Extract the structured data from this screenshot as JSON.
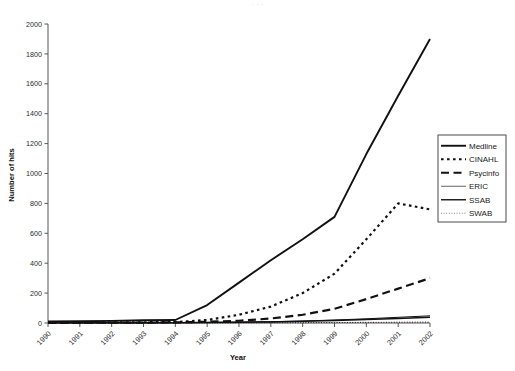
{
  "top_strip_text": "· ·   ·",
  "chart_data": {
    "type": "line",
    "title": "",
    "xlabel": "Year",
    "ylabel": "Number of hits",
    "x": [
      1990,
      1991,
      1992,
      1993,
      1994,
      1995,
      1996,
      1997,
      1998,
      1999,
      2000,
      2001,
      2002
    ],
    "categories": [
      "1990",
      "1991",
      "1992",
      "1993",
      "1994",
      "1995",
      "1996",
      "1997",
      "1998",
      "1999",
      "2000",
      "2001",
      "2002"
    ],
    "ylim": [
      0,
      2000
    ],
    "yticks": [
      0,
      200,
      400,
      600,
      800,
      1000,
      1200,
      1400,
      1600,
      1800,
      2000
    ],
    "ytick_labels": [
      "0",
      "200",
      "400",
      "600",
      "800",
      "1000",
      "1200",
      "1400",
      "1600",
      "1800",
      "2000"
    ],
    "grid": false,
    "legend_position": "right",
    "series": [
      {
        "name": "Medline",
        "style": "solid",
        "stroke_width": 1.9,
        "color": "#111111",
        "values": [
          10,
          12,
          14,
          18,
          20,
          120,
          270,
          420,
          560,
          710,
          1130,
          1520,
          1900
        ]
      },
      {
        "name": "CINAHL",
        "style": "dotted-dash",
        "stroke_width": 2.2,
        "color": "#111111",
        "values": [
          2,
          3,
          4,
          5,
          6,
          20,
          55,
          110,
          200,
          330,
          560,
          800,
          760
        ]
      },
      {
        "name": "Psycinfo",
        "style": "long-dash",
        "stroke_width": 2.2,
        "color": "#111111",
        "values": [
          1,
          2,
          2,
          3,
          4,
          8,
          15,
          30,
          55,
          95,
          160,
          230,
          300
        ]
      },
      {
        "name": "ERIC",
        "style": "solid-thin",
        "stroke_width": 1.0,
        "color": "#666666",
        "values": [
          1,
          1,
          2,
          2,
          3,
          4,
          6,
          9,
          13,
          20,
          28,
          38,
          48
        ]
      },
      {
        "name": "SSAB",
        "style": "solid-medium",
        "stroke_width": 1.5,
        "color": "#222222",
        "values": [
          1,
          1,
          1,
          2,
          2,
          3,
          5,
          7,
          11,
          16,
          23,
          30,
          38
        ]
      },
      {
        "name": "SWAB",
        "style": "fine-dotted",
        "stroke_width": 1.0,
        "color": "#888888",
        "values": [
          0,
          0,
          0,
          0,
          1,
          1,
          1,
          2,
          2,
          3,
          4,
          5,
          6
        ]
      }
    ]
  },
  "legend": {
    "items": [
      {
        "label": "Medline",
        "style": "solid"
      },
      {
        "label": "CINAHL",
        "style": "dotted-dash"
      },
      {
        "label": "Psycinfo",
        "style": "long-dash"
      },
      {
        "label": "ERIC",
        "style": "solid-thin"
      },
      {
        "label": "SSAB",
        "style": "solid-medium"
      },
      {
        "label": "SWAB",
        "style": "fine-dotted"
      }
    ]
  }
}
